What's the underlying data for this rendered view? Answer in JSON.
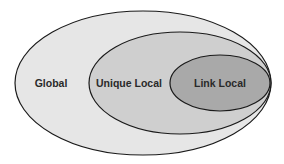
{
  "diagram": {
    "title": "",
    "type": "nested-sets",
    "regions": [
      {
        "label": "Global",
        "fill": "#e6e6e6",
        "stroke": "#1a1a1a"
      },
      {
        "label": "Unique Local",
        "fill": "#cfcfcf",
        "stroke": "#1a1a1a"
      },
      {
        "label": "Link Local",
        "fill": "#a9a9a9",
        "stroke": "#1a1a1a"
      }
    ]
  }
}
